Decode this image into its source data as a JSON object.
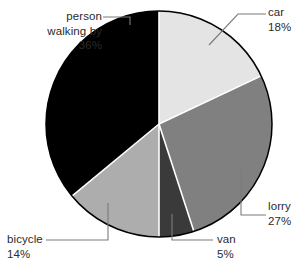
{
  "chart_data": {
    "type": "pie",
    "title": "",
    "subtitle": "",
    "xlabel": "",
    "ylabel": "",
    "grid": false,
    "legend_position": "none",
    "label_style": "callout-with-leader-lines",
    "start_angle_deg": 0,
    "direction": "clockwise",
    "units": "percent",
    "total": "100%",
    "categories": [
      "car",
      "lorry",
      "van",
      "bicycle",
      "person walking by"
    ],
    "values": [
      18,
      27,
      5,
      14,
      36
    ],
    "value_labels": [
      "18%",
      "27%",
      "5%",
      "14%",
      "36%"
    ],
    "colors": [
      "#e4e4e4",
      "#808080",
      "#3a3a3a",
      "#adadad",
      "#000000"
    ],
    "slices": [
      {
        "name": "car",
        "value": 18,
        "value_label": "18%",
        "color": "#e4e4e4"
      },
      {
        "name": "lorry",
        "value": 27,
        "value_label": "27%",
        "color": "#808080"
      },
      {
        "name": "van",
        "value": 5,
        "value_label": "5%",
        "color": "#3a3a3a"
      },
      {
        "name": "bicycle",
        "value": 14,
        "value_label": "14%",
        "color": "#adadad"
      },
      {
        "name": "person walking by",
        "value": 36,
        "value_label": "36%",
        "color": "#000000"
      }
    ]
  },
  "labels": {
    "car": {
      "name": "car",
      "value": "18%"
    },
    "lorry": {
      "name": "lorry",
      "value": "27%"
    },
    "van": {
      "name": "van",
      "value": "5%"
    },
    "bicycle": {
      "name": "bicycle",
      "value": "14%"
    },
    "person": {
      "name_line1": "person",
      "name_line2": "walking by",
      "value": "36%"
    }
  },
  "style": {
    "outline_color": "#000000",
    "separator_color": "#ffffff",
    "leader_color": "#7b7b7b",
    "text_color": "#2b2b2b",
    "background": "#ffffff"
  }
}
